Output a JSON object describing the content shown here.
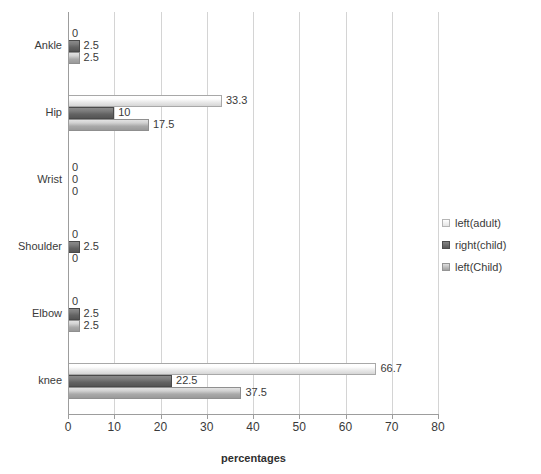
{
  "chart_data": {
    "type": "bar",
    "orientation": "horizontal",
    "title": "",
    "xlabel": "percentages",
    "ylabel": "",
    "xlim": [
      0,
      80
    ],
    "xticks": [
      0,
      10,
      20,
      30,
      40,
      50,
      60,
      70,
      80
    ],
    "grid": true,
    "legend_position": "right",
    "categories": [
      "Ankle",
      "Hip",
      "Wrist",
      "Shoulder",
      "Elbow",
      "knee"
    ],
    "series": [
      {
        "name": "left(adult)",
        "color": "#f2f2f2",
        "values": [
          0,
          33.3,
          0,
          0,
          0,
          66.7
        ],
        "labels": [
          "0",
          "33.3",
          "0",
          "0",
          "0",
          "66.7"
        ]
      },
      {
        "name": "right(child)",
        "color": "#636363",
        "values": [
          2.5,
          10,
          0,
          2.5,
          2.5,
          22.5
        ],
        "labels": [
          "2.5",
          "10",
          "0",
          "2.5",
          "2.5",
          "22.5"
        ]
      },
      {
        "name": "left(Child)",
        "color": "#a9a9a9",
        "values": [
          2.5,
          17.5,
          0,
          0,
          2.5,
          37.5
        ],
        "labels": [
          "2.5",
          "17.5",
          "0",
          "0",
          "2.5",
          "37.5"
        ]
      }
    ]
  },
  "legend": {
    "items": [
      {
        "label": "left(adult)"
      },
      {
        "label": "right(child)"
      },
      {
        "label": "left(Child)"
      }
    ]
  }
}
